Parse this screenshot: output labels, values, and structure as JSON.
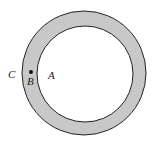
{
  "diagram": {
    "type": "annulus",
    "outer_circle": {
      "cx": 84,
      "cy": 73,
      "r": 62
    },
    "inner_circle": {
      "cx": 85,
      "cy": 74,
      "r": 48
    },
    "ring_fill": "#c8c8c8",
    "inner_fill": "#ffffff",
    "stroke": "#222222",
    "point": {
      "label": "B",
      "x": 31,
      "y": 73
    },
    "labels": {
      "C": "C",
      "B": "B",
      "A": "A"
    }
  }
}
